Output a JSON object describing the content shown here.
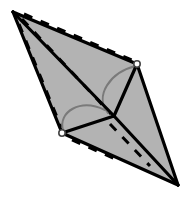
{
  "figure": {
    "canvas": {
      "width": 188,
      "height": 205,
      "background": "#ffffff"
    },
    "style": {
      "face_fill": "#b3b3b3",
      "edge_color": "#000000",
      "edge_width": 3.2,
      "hidden_edge_color": "#000000",
      "hidden_edge_width": 3.0,
      "hidden_edge_dash": "9 9",
      "arc_color": "#7a7a7a",
      "arc_width": 2.0,
      "vertex_marker_stroke": "#444444",
      "vertex_marker_fill": "#ffffff",
      "vertex_marker_radius": 3.2
    },
    "vertices": [
      {
        "id": "A",
        "role": "apex-top-left",
        "x": 13,
        "y": 12,
        "marked": false
      },
      {
        "id": "B",
        "role": "upper-right",
        "x": 137,
        "y": 64,
        "marked": true
      },
      {
        "id": "C",
        "role": "center",
        "x": 114,
        "y": 116,
        "marked": false
      },
      {
        "id": "D",
        "role": "lower-left",
        "x": 62,
        "y": 133,
        "marked": true
      },
      {
        "id": "E",
        "role": "bottom-right",
        "x": 178,
        "y": 185,
        "marked": false
      }
    ],
    "faces": [
      {
        "id": "outline",
        "vertices": [
          "A",
          "B",
          "E",
          "D"
        ]
      }
    ],
    "solid_edges": [
      {
        "from": "A",
        "to": "B"
      },
      {
        "from": "B",
        "to": "E"
      },
      {
        "from": "E",
        "to": "D"
      },
      {
        "from": "D",
        "to": "A"
      },
      {
        "from": "A",
        "to": "C"
      },
      {
        "from": "B",
        "to": "C"
      },
      {
        "from": "C",
        "to": "D"
      },
      {
        "from": "C",
        "to": "E"
      }
    ],
    "hidden_edges": [
      {
        "from": "A",
        "to": "B",
        "offset": "upper-dashed"
      },
      {
        "from": "A",
        "to": "C",
        "offset": "middle-dashed"
      },
      {
        "from": "A",
        "to": "D",
        "offset": "lower-dashed"
      },
      {
        "from": "C",
        "to": "E",
        "offset": "bottom-dashed"
      }
    ],
    "angle_arcs": [
      {
        "id": "arc-at-B",
        "at_vertex": "B",
        "to_vertex": "C",
        "label": ""
      },
      {
        "id": "arc-at-D",
        "at_vertex": "D",
        "to_vertex": "C",
        "label": ""
      }
    ]
  }
}
